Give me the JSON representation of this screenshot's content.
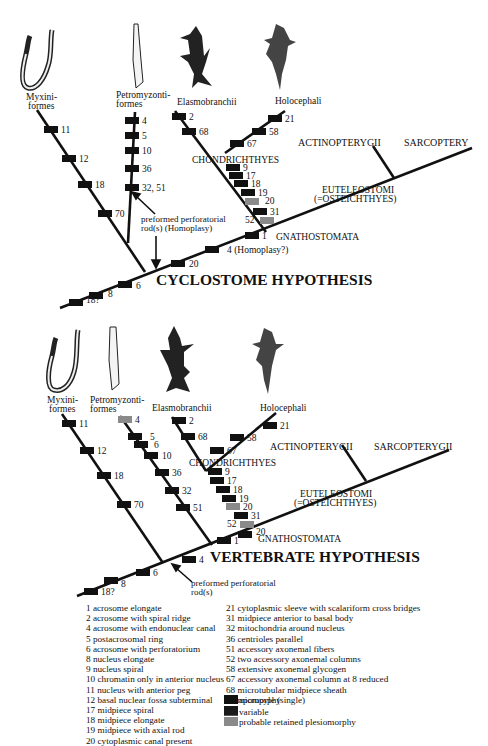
{
  "colors": {
    "apomorphy": "#111111",
    "variable": "#111111",
    "plesiomorphy": "#8a8a8a",
    "line": "#111111"
  },
  "taxa": {
    "myxini": "Myxini-|formes",
    "petromyzonti": "Petromyzonti-|formes",
    "elasmobranchii": "Elasmobranchii",
    "holocephali": "Holocephali",
    "actinopterygii": "ACTINOPTERYGII",
    "sarcopterygii_top": "SARCOPTERY",
    "sarcopterygii_bottom": "SARCOPTERYGII",
    "chondrichthyes": "CHONDRICHTHYES",
    "euteleostomi": "EUTELEOSTOMI",
    "osteichthyes": "(=OSTEICHTHYES)",
    "gnathostomata": "GNATHOSTOMATA"
  },
  "hypotheses": [
    {
      "title": "CYCLOSTOME HYPOTHESIS",
      "annotation": "preformed perforatorial|rod(s) (Homoplasy)",
      "myxini_chars": [
        "11",
        "12",
        "18",
        "70"
      ],
      "petromyzonti_chars": [
        "4",
        "5",
        "10",
        "36",
        "32, 51"
      ],
      "elasmobranchii_chars": [
        "2",
        "68"
      ],
      "holocephali_chars": [
        "21",
        "58",
        "67"
      ],
      "chondrichthyes_chars": [
        "9",
        "17",
        "18",
        "19",
        "20",
        "31",
        "52"
      ],
      "gnathostomata_chars": [
        "1"
      ],
      "stem_chars": [
        "18?",
        "8",
        "6",
        "20",
        "4 (Homoplasy?)"
      ]
    },
    {
      "title": "VERTEBRATE HYPOTHESIS",
      "annotation": "preformed perforatorial|rod(s)",
      "myxini_chars": [
        "11",
        "12",
        "18",
        "70"
      ],
      "petromyzonti_chars": [
        "4",
        "5",
        "6",
        "10",
        "36",
        "32",
        "51"
      ],
      "elasmobranchii_chars": [
        "2",
        "68"
      ],
      "holocephali_chars": [
        "21",
        "58",
        "67"
      ],
      "chondrichthyes_chars": [
        "9",
        "17",
        "18",
        "19",
        "20",
        "31",
        "52"
      ],
      "gnathostomata_chars": [
        "20",
        "1"
      ],
      "stem_chars": [
        "18?",
        "8",
        "6",
        "4"
      ]
    }
  ],
  "characters_left": [
    "1  acrosome elongate",
    "2  acrosome with spiral ridge",
    "4  acrosome with endonuclear canal",
    "5  postacrosomal ring",
    "6 acrosome with perforatorium",
    "8  nucleus elongate",
    "9  nucleus spiral",
    "10 chromatin only in anterior nucleus",
    "11 nucleus with anterior peg",
    "12 basal nuclear fossa subterminal",
    "17 midpiece spiral",
    "18 midpiece elongate",
    "19 midpiece with axial rod",
    "20 cytoplasmic canal present"
  ],
  "characters_right": [
    "21 cytoplasmic sleeve with scalariform cross bridges",
    "31 midpiece anterior to basal body",
    "32 mitochondria around nucleus",
    "36 centrioles parallel",
    "51 accessory axonemal fibers",
    "52 two accessory axonemal columns",
    "58 extensive axonemal glycogen",
    "67 accessory axonemal column at 8 reduced",
    "68 microtubular midpiece sheath",
    "70 micropyle (single)"
  ],
  "key": [
    {
      "label": "apomorphy",
      "color": "#111111"
    },
    {
      "label": "variable",
      "color": "#1a1a1a"
    },
    {
      "label": "probable retained plesiomorphy",
      "color": "#8a8a8a"
    }
  ]
}
